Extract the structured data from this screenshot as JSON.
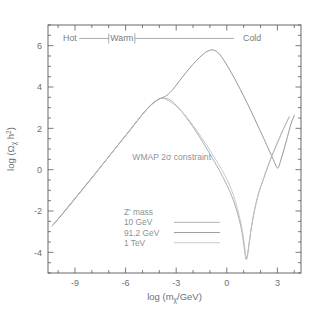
{
  "figure": {
    "background_color": "#ffffff",
    "frame_color": "#555a5f"
  },
  "chart_data": {
    "type": "line",
    "title": "",
    "xlabel": "log (mχ/GeV)",
    "ylabel": "log (Ωχ h²)",
    "xlim": [
      -10.6,
      4.4
    ],
    "ylim": [
      -5.0,
      7.0
    ],
    "grid": false,
    "legend_position": "lower-left-inside",
    "x_major_ticks": [
      -9,
      -6,
      -3,
      0,
      3
    ],
    "x_major_tick_labels": [
      "-9",
      "-6",
      "-3",
      "0",
      "3"
    ],
    "x_minor_tick_step": 1,
    "y_major_ticks": [
      -4,
      -2,
      0,
      2,
      4,
      6
    ],
    "y_major_tick_labels": [
      "-4",
      "-2",
      "0",
      "2",
      "4",
      "6"
    ],
    "y_minor_tick_step": 0.5,
    "annotations": [
      {
        "name": "wmap-constraint",
        "text": "WMAP 2σ constraint",
        "x": -5.6,
        "y": 0.45
      },
      {
        "name": "regime-hot",
        "text": "Hot",
        "x": -9.3,
        "y": 6.35
      },
      {
        "name": "regime-warm",
        "text": "Warm",
        "x": -6.4,
        "y": 6.35
      },
      {
        "name": "regime-cold",
        "text": "Cold",
        "x": 1.1,
        "y": 6.35
      }
    ],
    "regime_dividers_x": [
      -7.0,
      -5.45
    ],
    "legend_title": "Z' mass",
    "series": [
      {
        "name": "10 GeV",
        "label": "10 GeV",
        "color": "#9aa0a6",
        "points": [
          [
            -10.35,
            -2.72
          ],
          [
            -9.6,
            -2.0
          ],
          [
            -8.8,
            -1.2
          ],
          [
            -8.0,
            -0.4
          ],
          [
            -7.2,
            0.42
          ],
          [
            -6.4,
            1.24
          ],
          [
            -5.6,
            2.06
          ],
          [
            -5.0,
            2.68
          ],
          [
            -4.5,
            3.12
          ],
          [
            -4.1,
            3.38
          ],
          [
            -3.85,
            3.46
          ],
          [
            -3.6,
            3.45
          ],
          [
            -3.3,
            3.34
          ],
          [
            -3.0,
            3.12
          ],
          [
            -2.6,
            2.74
          ],
          [
            -2.2,
            2.3
          ],
          [
            -1.8,
            1.82
          ],
          [
            -1.4,
            1.3
          ],
          [
            -1.0,
            0.76
          ],
          [
            -0.6,
            0.2
          ],
          [
            -0.2,
            -0.4
          ],
          [
            0.15,
            -1.0
          ],
          [
            0.45,
            -1.62
          ],
          [
            0.7,
            -2.3
          ],
          [
            0.9,
            -3.0
          ],
          [
            1.02,
            -3.7
          ],
          [
            1.1,
            -4.18
          ],
          [
            1.16,
            -4.35
          ],
          [
            1.24,
            -4.1
          ],
          [
            1.34,
            -3.5
          ],
          [
            1.48,
            -2.7
          ],
          [
            1.66,
            -1.9
          ],
          [
            1.9,
            -1.1
          ],
          [
            2.2,
            -0.4
          ],
          [
            2.5,
            0.3
          ],
          [
            2.9,
            1.1
          ],
          [
            3.3,
            1.85
          ],
          [
            3.7,
            2.55
          ]
        ]
      },
      {
        "name": "91.2 GeV",
        "label": "91.2 GeV",
        "color": "#7f8489",
        "points": [
          [
            -10.35,
            -2.72
          ],
          [
            -9.6,
            -2.0
          ],
          [
            -8.8,
            -1.2
          ],
          [
            -8.0,
            -0.4
          ],
          [
            -7.2,
            0.42
          ],
          [
            -6.4,
            1.24
          ],
          [
            -5.6,
            2.06
          ],
          [
            -5.0,
            2.68
          ],
          [
            -4.5,
            3.12
          ],
          [
            -4.1,
            3.38
          ],
          [
            -3.85,
            3.47
          ],
          [
            -3.55,
            3.6
          ],
          [
            -3.2,
            3.88
          ],
          [
            -2.8,
            4.3
          ],
          [
            -2.4,
            4.72
          ],
          [
            -2.0,
            5.1
          ],
          [
            -1.6,
            5.44
          ],
          [
            -1.25,
            5.68
          ],
          [
            -1.0,
            5.78
          ],
          [
            -0.85,
            5.8
          ],
          [
            -0.65,
            5.74
          ],
          [
            -0.4,
            5.56
          ],
          [
            -0.1,
            5.2
          ],
          [
            0.25,
            4.72
          ],
          [
            0.6,
            4.2
          ],
          [
            1.0,
            3.56
          ],
          [
            1.4,
            2.9
          ],
          [
            1.8,
            2.2
          ],
          [
            2.2,
            1.5
          ],
          [
            2.5,
            0.95
          ],
          [
            2.75,
            0.5
          ],
          [
            2.9,
            0.22
          ],
          [
            3.0,
            0.08
          ],
          [
            3.08,
            0.14
          ],
          [
            3.2,
            0.45
          ],
          [
            3.4,
            1.0
          ],
          [
            3.6,
            1.6
          ],
          [
            3.8,
            2.2
          ],
          [
            4.0,
            2.62
          ]
        ]
      },
      {
        "name": "1 TeV",
        "label": "1 TeV",
        "color": "#b9bec3",
        "points": [
          [
            -10.35,
            -2.72
          ],
          [
            -9.0,
            -1.38
          ],
          [
            -7.5,
            0.12
          ],
          [
            -6.0,
            1.64
          ],
          [
            -4.6,
            3.06
          ],
          [
            -4.0,
            3.42
          ],
          [
            -3.85,
            3.46
          ],
          [
            -3.7,
            3.44
          ],
          [
            -3.4,
            3.3
          ],
          [
            -3.0,
            3.08
          ],
          [
            -2.5,
            2.66
          ],
          [
            -2.0,
            2.14
          ],
          [
            -1.5,
            1.56
          ],
          [
            -1.0,
            0.94
          ],
          [
            -0.5,
            0.28
          ],
          [
            0.0,
            -0.45
          ],
          [
            0.4,
            -1.25
          ],
          [
            0.7,
            -2.1
          ],
          [
            0.92,
            -2.95
          ],
          [
            1.06,
            -3.75
          ],
          [
            1.15,
            -4.3
          ],
          [
            1.22,
            -4.12
          ],
          [
            1.32,
            -3.55
          ],
          [
            1.46,
            -2.78
          ],
          [
            1.64,
            -1.98
          ],
          [
            1.88,
            -1.16
          ],
          [
            2.18,
            -0.42
          ],
          [
            2.5,
            0.32
          ],
          [
            2.9,
            1.12
          ],
          [
            3.3,
            1.88
          ],
          [
            3.7,
            2.56
          ]
        ]
      }
    ]
  },
  "axis_labels": {
    "x_title_prefix": "log (m",
    "x_title_sub": "χ",
    "x_title_suffix": "/GeV)",
    "y_title_prefix": "log (",
    "y_title_omega": "Ω",
    "y_title_sub": "χ",
    "y_title_h": " h",
    "y_title_sup": "2",
    "y_title_suffix": ")"
  },
  "legend": {
    "title": "Z' mass",
    "entries": [
      {
        "label": "10 GeV",
        "color": "#9aa0a6"
      },
      {
        "label": "91.2 GeV",
        "color": "#7f8489"
      },
      {
        "label": "1 TeV",
        "color": "#b9bec3"
      }
    ]
  }
}
